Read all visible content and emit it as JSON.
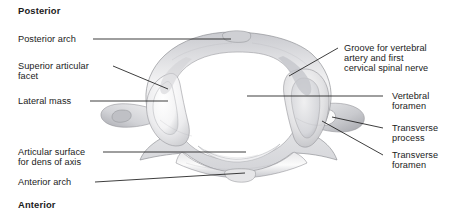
{
  "figure": {
    "background_color": "#ffffff",
    "leader_line_color": "#1b1b1b",
    "bone_colors": {
      "highlight": "#fbfbfb",
      "midtone": "#dcdcdc",
      "shadow": "#a9a9ad",
      "outline": "#8f9095",
      "foramen_fill": "#ffffff"
    }
  },
  "orientation": {
    "top_label": "Posterior",
    "bottom_label": "Anterior"
  },
  "labels_left": [
    {
      "id": "posterior-arch",
      "text": "Posterior arch"
    },
    {
      "id": "superior-articular-facet",
      "line1": "Superior articular",
      "line2": "facet"
    },
    {
      "id": "lateral-mass",
      "text": "Lateral mass"
    },
    {
      "id": "articular-surface-dens",
      "line1": "Articular surface",
      "line2": "for dens of axis"
    },
    {
      "id": "anterior-arch",
      "text": "Anterior arch"
    }
  ],
  "labels_right": [
    {
      "id": "groove-vertebral-artery",
      "line1": "Groove for vertebral",
      "line2": "artery and first",
      "line3": "cervical spinal nerve"
    },
    {
      "id": "vertebral-foramen",
      "line1": "Vertebral",
      "line2": "foramen"
    },
    {
      "id": "transverse-process",
      "line1": "Transverse",
      "line2": "process"
    },
    {
      "id": "transverse-foramen",
      "line1": "Transverse",
      "line2": "foramen"
    }
  ]
}
